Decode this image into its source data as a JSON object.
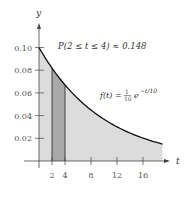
{
  "chart_data": {
    "type": "area",
    "title": "",
    "function_label": "f(t) = 1/10 e^(-t/10)",
    "annotation": "P(2 ≤ t ≤ 4) ≈ 0.148",
    "xlabel": "t",
    "ylabel": "y",
    "x_ticks": [
      2,
      4,
      8,
      12,
      16
    ],
    "y_ticks": [
      0.02,
      0.04,
      0.06,
      0.08,
      0.1
    ],
    "y_tick_labels": [
      "0.02",
      "0.04",
      "0.06",
      "0.08",
      "0.10"
    ],
    "xlim": [
      0,
      20
    ],
    "ylim": [
      0,
      0.12
    ],
    "highlighted_interval": [
      2,
      4
    ],
    "highlighted_probability": 0.148,
    "shaded_region": [
      0,
      19
    ],
    "grid": false,
    "colors": {
      "curve": "#111111",
      "shade": "#dcdcdc",
      "highlight": "#a8a8a8"
    }
  },
  "labels": {
    "y_axis": "y",
    "x_axis": "t",
    "annotation": "P(2 ≤ t ≤ 4) ≈ 0.148",
    "func_left": "f(t) = ",
    "func_num": "1",
    "func_den": "10",
    "func_e": "e",
    "func_exp": "−t/10",
    "xt": [
      "2",
      "4",
      "8",
      "12",
      "16"
    ],
    "yt": [
      "0.02",
      "0.04",
      "0.06",
      "0.08",
      "0.10"
    ]
  }
}
